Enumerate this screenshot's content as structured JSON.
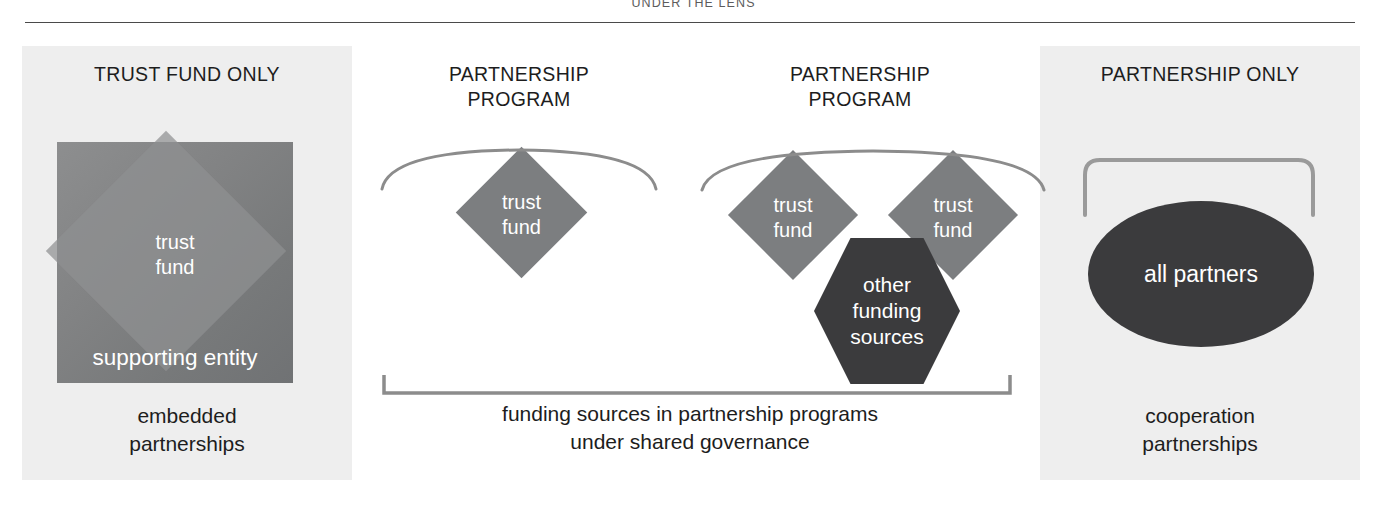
{
  "header": {
    "title": "UNDER THE LENS"
  },
  "panels": [
    {
      "id": "trust-fund-only",
      "title": "TRUST FUND ONLY",
      "shapes": {
        "square_inner_label": "trust\nfund",
        "square_inner_line1": "trust",
        "square_inner_line2": "fund",
        "square_bottom_label": "supporting entity"
      },
      "caption_line1": "embedded",
      "caption_line2": "partnerships"
    },
    {
      "id": "partnership-program-single",
      "title_line1": "PARTNERSHIP",
      "title_line2": "PROGRAM",
      "diamond": {
        "line1": "trust",
        "line2": "fund"
      }
    },
    {
      "id": "partnership-program-multi",
      "title_line1": "PARTNERSHIP",
      "title_line2": "PROGRAM",
      "diamond_left": {
        "line1": "trust",
        "line2": "fund"
      },
      "diamond_right": {
        "line1": "trust",
        "line2": "fund"
      },
      "hexagon": {
        "line1": "other",
        "line2": "funding",
        "line3": "sources"
      }
    },
    {
      "id": "partnership-only",
      "title": "PARTNERSHIP ONLY",
      "ellipse_label": "all partners",
      "caption_line1": "cooperation",
      "caption_line2": "partnerships"
    }
  ],
  "shared_bracket": {
    "caption_line1": "funding sources in partnership programs",
    "caption_line2": "under shared governance"
  },
  "colors": {
    "page_background": "#ffffff",
    "panel_tint": "#eeeeee",
    "square_fill": "#828384",
    "diamond_fill": "#7c7e80",
    "dark_shape_fill": "#3b3b3d",
    "bracket_stroke": "#8c8c8c",
    "rule_stroke": "#4a4a4a",
    "text_dark": "#1d1d1d",
    "text_light": "#ffffff"
  }
}
